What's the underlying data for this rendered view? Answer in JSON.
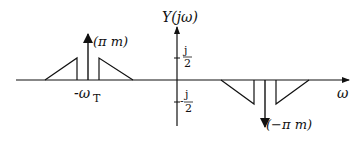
{
  "diagram": {
    "title": "Y(jω)",
    "x_axis_label": "ω",
    "y_ticks": [
      {
        "num": "j",
        "den": "2",
        "sign": ""
      },
      {
        "num": "j",
        "den": "2",
        "sign": "-"
      }
    ],
    "x_tick_label": "-ω",
    "x_tick_subscript": "T",
    "impulse_pos_label": "(π m)",
    "impulse_neg_label": "(−π m)",
    "colors": {
      "stroke": "#111111",
      "background": "#ffffff"
    }
  }
}
